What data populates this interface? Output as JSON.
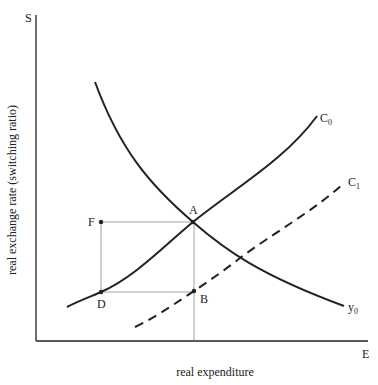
{
  "diagram": {
    "type": "economics-curve-diagram",
    "axes": {
      "y_symbol": "S",
      "x_symbol": "E",
      "y_label": "real exchange rate (switching ratio)",
      "x_label": "real expenditure"
    },
    "curves": [
      {
        "id": "y0",
        "label": "y",
        "subscript": "0",
        "style": "solid",
        "description": "downward-sloping curve"
      },
      {
        "id": "C0",
        "label": "C",
        "subscript": "0",
        "style": "solid",
        "description": "upward-sloping curve"
      },
      {
        "id": "C1",
        "label": "C",
        "subscript": "1",
        "style": "dashed",
        "description": "upward-sloping curve shifted right"
      }
    ],
    "points": [
      {
        "id": "A",
        "label": "A",
        "on": [
          "y0",
          "C0"
        ]
      },
      {
        "id": "B",
        "label": "B",
        "on": [
          "C1"
        ]
      },
      {
        "id": "D",
        "label": "D",
        "on": [
          "C0"
        ]
      },
      {
        "id": "F",
        "label": "F",
        "on": []
      }
    ],
    "guide_lines": [
      {
        "from": "F",
        "to": "A"
      },
      {
        "from": "F",
        "to": "D"
      },
      {
        "from": "D",
        "to": "B"
      },
      {
        "from": "A",
        "to": "x-axis"
      }
    ],
    "colors": {
      "ink": "#222222",
      "guide": "#888888"
    }
  }
}
